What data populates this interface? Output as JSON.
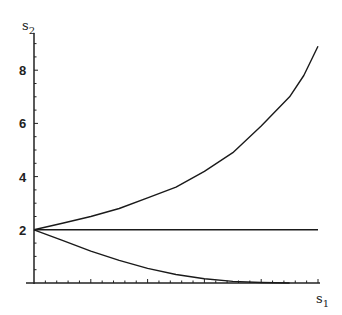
{
  "chart_data": {
    "type": "line",
    "title": "",
    "xlabel": "s1",
    "ylabel": "s2",
    "xlabel_main": "s",
    "xlabel_sub": "1",
    "ylabel_main": "s",
    "ylabel_sub": "2",
    "ylim": [
      0,
      9
    ],
    "yticks": [
      2,
      4,
      6,
      8
    ],
    "ytick_labels": [
      "2",
      "4",
      "6",
      "8"
    ],
    "xticks_labeled": false,
    "grid": false,
    "series": [
      {
        "name": "upper-curve",
        "x": [
          0,
          0.1,
          0.2,
          0.3,
          0.4,
          0.5,
          0.6,
          0.7,
          0.8,
          0.9,
          0.95,
          1.0
        ],
        "values": [
          2.0,
          2.25,
          2.5,
          2.8,
          3.2,
          3.6,
          4.2,
          4.9,
          5.9,
          7.0,
          7.8,
          8.9
        ]
      },
      {
        "name": "constant-line",
        "x": [
          0,
          1.0
        ],
        "values": [
          2.0,
          2.0
        ]
      },
      {
        "name": "lower-curve",
        "x": [
          0,
          0.1,
          0.2,
          0.3,
          0.4,
          0.5,
          0.6,
          0.7,
          0.8,
          0.9
        ],
        "values": [
          2.0,
          1.6,
          1.2,
          0.85,
          0.55,
          0.32,
          0.16,
          0.06,
          0.02,
          0.0
        ]
      }
    ]
  }
}
